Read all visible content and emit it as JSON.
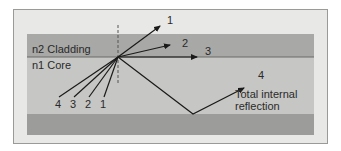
{
  "diagram": {
    "layers": {
      "cladding_label": "n2 Cladding",
      "core_label": "n1 Core"
    },
    "rays": [
      {
        "id": "1",
        "label": "1",
        "description": "refracted out through cladding"
      },
      {
        "id": "2",
        "label": "2",
        "description": "refracted in cladding"
      },
      {
        "id": "3",
        "label": "3",
        "description": "critical angle, along boundary"
      },
      {
        "id": "4",
        "label": "4",
        "description": "total internal reflection"
      }
    ],
    "incident_labels": [
      "4",
      "3",
      "2",
      "1"
    ],
    "annotation_line1": "Total internal",
    "annotation_line2": "reflection",
    "colors": {
      "background": "#e8e8e6",
      "cladding": "#a8a8a6",
      "core": "#c4c4c2",
      "lower_cladding": "#9c9c9a",
      "line": "#1a1a1a"
    }
  }
}
